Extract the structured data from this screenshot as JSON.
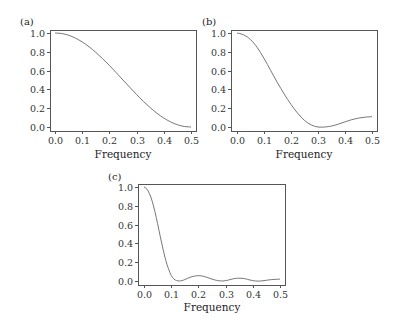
{
  "chart_data": [
    {
      "type": "line",
      "panel_label": "(a)",
      "title": "",
      "xlabel": "Frequency",
      "ylabel": "",
      "xlim": [
        0.0,
        0.5
      ],
      "ylim": [
        0.0,
        1.0
      ],
      "x_ticks": [
        "0.0",
        "0.1",
        "0.2",
        "0.3",
        "0.4",
        "0.5"
      ],
      "y_ticks": [
        "0.0",
        "0.2",
        "0.4",
        "0.6",
        "0.8",
        "1.0"
      ],
      "grid": false,
      "x": [
        0.0,
        0.025,
        0.05,
        0.075,
        0.1,
        0.125,
        0.15,
        0.175,
        0.2,
        0.225,
        0.25,
        0.275,
        0.3,
        0.325,
        0.35,
        0.375,
        0.4,
        0.425,
        0.45,
        0.475,
        0.5
      ],
      "values": [
        1.0,
        0.994,
        0.976,
        0.946,
        0.905,
        0.854,
        0.794,
        0.727,
        0.655,
        0.578,
        0.5,
        0.422,
        0.345,
        0.273,
        0.206,
        0.146,
        0.095,
        0.054,
        0.024,
        0.006,
        0.0
      ]
    },
    {
      "type": "line",
      "panel_label": "(b)",
      "title": "",
      "xlabel": "Frequency",
      "ylabel": "",
      "xlim": [
        0.0,
        0.5
      ],
      "ylim": [
        0.0,
        1.0
      ],
      "x_ticks": [
        "0.0",
        "0.1",
        "0.2",
        "0.3",
        "0.4",
        "0.5"
      ],
      "y_ticks": [
        "0.0",
        "0.2",
        "0.4",
        "0.6",
        "0.8",
        "1.0"
      ],
      "grid": false,
      "x": [
        0.0,
        0.025,
        0.05,
        0.075,
        0.1,
        0.125,
        0.15,
        0.175,
        0.2,
        0.225,
        0.25,
        0.275,
        0.3,
        0.325,
        0.35,
        0.375,
        0.4,
        0.425,
        0.45,
        0.475,
        0.5
      ],
      "values": [
        1.0,
        0.98,
        0.93,
        0.845,
        0.73,
        0.6,
        0.47,
        0.35,
        0.24,
        0.145,
        0.07,
        0.022,
        0.0,
        0.0,
        0.01,
        0.03,
        0.055,
        0.078,
        0.095,
        0.105,
        0.11
      ]
    },
    {
      "type": "line",
      "panel_label": "(c)",
      "title": "",
      "xlabel": "Frequency",
      "ylabel": "",
      "xlim": [
        0.0,
        0.5
      ],
      "ylim": [
        0.0,
        1.0
      ],
      "x_ticks": [
        "0.0",
        "0.1",
        "0.2",
        "0.3",
        "0.4",
        "0.5"
      ],
      "y_ticks": [
        "0.0",
        "0.2",
        "0.4",
        "0.6",
        "0.8",
        "1.0"
      ],
      "grid": false,
      "x": [
        0.0,
        0.01,
        0.02,
        0.03,
        0.04,
        0.05,
        0.06,
        0.07,
        0.08,
        0.09,
        0.1,
        0.11,
        0.12,
        0.13,
        0.14,
        0.15,
        0.17,
        0.19,
        0.21,
        0.23,
        0.25,
        0.27,
        0.29,
        0.31,
        0.33,
        0.35,
        0.37,
        0.39,
        0.41,
        0.43,
        0.45,
        0.47,
        0.5
      ],
      "values": [
        1.0,
        0.98,
        0.93,
        0.85,
        0.74,
        0.61,
        0.47,
        0.34,
        0.22,
        0.13,
        0.06,
        0.02,
        0.005,
        0.0,
        0.005,
        0.015,
        0.04,
        0.055,
        0.055,
        0.04,
        0.02,
        0.005,
        0.0,
        0.01,
        0.025,
        0.03,
        0.025,
        0.01,
        0.0,
        0.0,
        0.008,
        0.015,
        0.02
      ]
    }
  ]
}
